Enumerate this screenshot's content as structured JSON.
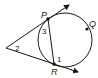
{
  "diagram": {
    "type": "circle-tangent-secant",
    "points": {
      "P": {
        "label": "P",
        "x": 48,
        "y": 19
      },
      "Q": {
        "label": "Q",
        "x": 87,
        "y": 29
      },
      "R": {
        "label": "R",
        "x": 54,
        "y": 64
      }
    },
    "vertex": {
      "x": 6,
      "y": 48
    },
    "circle": {
      "cx": 65,
      "cy": 40,
      "r": 27
    },
    "angles": [
      {
        "label": "1",
        "at": "R"
      },
      {
        "label": "2",
        "at": "external vertex"
      },
      {
        "label": "3",
        "at": "P"
      }
    ],
    "colors": {
      "stroke": "#1a1a1a",
      "background": "#ffffff"
    }
  }
}
